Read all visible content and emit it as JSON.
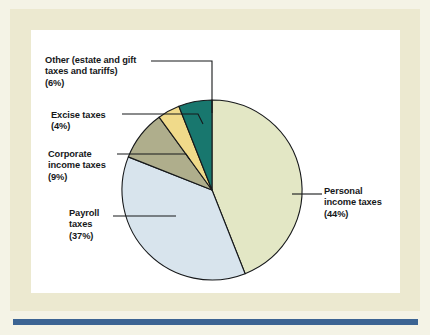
{
  "figure": {
    "background_color": "#f4f3e6",
    "mat_color": "#ece9d0",
    "panel_color": "#ffffff",
    "rule_color": "#3c6493",
    "outline_color": "#16181a"
  },
  "chart_data": {
    "type": "pie",
    "title": "",
    "subtitle": "",
    "xlabel": "",
    "ylabel": "",
    "legend_position": "callout-labels",
    "grid": false,
    "total": 100,
    "units": "percent",
    "start_angle_deg": 0,
    "direction": "clockwise",
    "categories": [
      "Personal income taxes",
      "Payroll taxes",
      "Corporate income taxes",
      "Excise taxes",
      "Other (estate and gift taxes and tariffs)"
    ],
    "values": [
      44,
      37,
      9,
      4,
      6
    ],
    "colors": [
      "#e3e7c5",
      "#d8e4ed",
      "#afae8c",
      "#f0da8a",
      "#18776e"
    ],
    "slices": [
      {
        "name": "personal-income-taxes",
        "label_lines": [
          "Personal",
          "income taxes",
          "(44%)"
        ],
        "value": 44,
        "percent_text": "(44%)",
        "color": "#e3e7c5"
      },
      {
        "name": "payroll-taxes",
        "label_lines": [
          "Payroll",
          "taxes",
          "(37%)"
        ],
        "value": 37,
        "percent_text": "(37%)",
        "color": "#d8e4ed"
      },
      {
        "name": "corporate-income-taxes",
        "label_lines": [
          "Corporate",
          "income taxes",
          "(9%)"
        ],
        "value": 9,
        "percent_text": "(9%)",
        "color": "#afae8c"
      },
      {
        "name": "excise-taxes",
        "label_lines": [
          "Excise taxes",
          "(4%)"
        ],
        "value": 4,
        "percent_text": "(4%)",
        "color": "#f0da8a"
      },
      {
        "name": "other-taxes",
        "label_lines": [
          "Other (estate and gift",
          "taxes and tariffs)",
          "(6%)"
        ],
        "value": 6,
        "percent_text": "(6%)",
        "color": "#18776e"
      }
    ]
  },
  "labels": {
    "other": {
      "line1": "Other (estate and gift",
      "line2": "taxes and tariffs)",
      "line3": "(6%)"
    },
    "excise": {
      "line1": "Excise taxes",
      "line2": "(4%)"
    },
    "corporate": {
      "line1": "Corporate",
      "line2": "income taxes",
      "line3": "(9%)"
    },
    "payroll": {
      "line1": "Payroll",
      "line2": "taxes",
      "line3": "(37%)"
    },
    "personal": {
      "line1": "Personal",
      "line2": "income taxes",
      "line3": "(44%)"
    }
  }
}
